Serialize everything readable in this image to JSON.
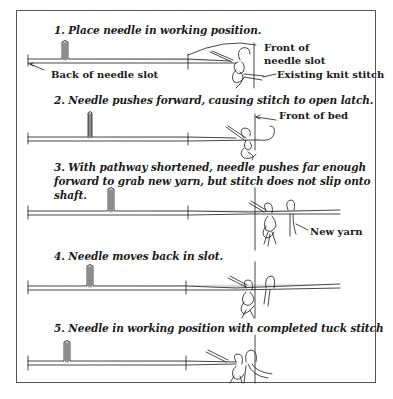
{
  "figure": {
    "type": "diagram",
    "steps": [
      {
        "number": "1",
        "title": "1. Place needle in working position."
      },
      {
        "number": "2",
        "title": "2. Needle pushes forward, causing stitch to open latch."
      },
      {
        "number": "3",
        "title_line1": "3. With pathway shortened, needle pushes far enough",
        "title_line2": "forward to grab new yarn, but stitch does not slip onto",
        "title_line3": "shaft."
      },
      {
        "number": "4",
        "title": "4. Needle moves back in slot."
      },
      {
        "number": "5",
        "title": "5. Needle in working position with completed tuck stitch"
      }
    ],
    "labels": {
      "back_of_needle_slot": "Back of needle slot",
      "front_of_needle_slot_line1": "Front of",
      "front_of_needle_slot_line2": "needle slot",
      "existing_knit_stitch": "Existing knit stitch",
      "front_of_bed": "Front of bed",
      "new_yarn": "New yarn"
    },
    "colors": {
      "ink": "#1a1a1a",
      "needle_fill": "#d9d9d9",
      "frame": "#555555",
      "background": "#ffffff"
    }
  }
}
